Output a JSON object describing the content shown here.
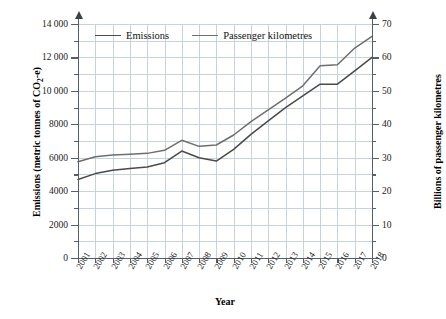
{
  "chart_data": {
    "type": "line",
    "title": "",
    "xlabel": "Year",
    "ylabel": "Emissions (metric tonnes of CO2-e)",
    "y2label": "Billions of passenger kilometres",
    "grid": true,
    "legend_position": "top-left-inside",
    "categories": [
      "2001",
      "2002",
      "2003",
      "2004",
      "2005",
      "2006",
      "2007",
      "2008",
      "2009",
      "2010",
      "2011",
      "2012",
      "2013",
      "2014",
      "2015",
      "2016",
      "2017",
      "2018"
    ],
    "xlim": [
      2001,
      2018
    ],
    "ylim": [
      0,
      14000
    ],
    "y2lim": [
      0,
      70
    ],
    "yticks": [
      0,
      2000,
      4000,
      6000,
      8000,
      10000,
      12000,
      14000
    ],
    "ytick_labels": [
      "0",
      "2000",
      "4000",
      "6000",
      "8000",
      "10 000",
      "12 000",
      "14 000"
    ],
    "y2ticks": [
      0,
      10,
      20,
      30,
      40,
      50,
      60,
      70
    ],
    "y2tick_labels": [
      "0",
      "10",
      "20",
      "30",
      "40",
      "50",
      "60",
      "70"
    ],
    "series": [
      {
        "name": "Emissions",
        "axis": "left",
        "units": "metric tonnes of CO2-e",
        "color": "#4a4a4a",
        "values": [
          4700,
          5050,
          5250,
          5350,
          5450,
          5700,
          6400,
          6000,
          5800,
          6500,
          7400,
          8200,
          9000,
          9700,
          10400,
          10400,
          11200,
          12000
        ]
      },
      {
        "name": "Passenger kilometres",
        "axis": "right",
        "units": "billions of passenger kilometres",
        "color": "#6e6e6e",
        "values": [
          28.8,
          30.3,
          30.8,
          31.0,
          31.3,
          32.2,
          35.2,
          33.4,
          33.8,
          36.8,
          40.8,
          44.3,
          47.8,
          51.5,
          57.5,
          57.8,
          62.8,
          66.3
        ]
      }
    ]
  },
  "axis_titles": {
    "x": "Year",
    "y_left_prefix": "Emissions (metric tonnes of CO",
    "y_left_sub": "2",
    "y_left_suffix": "-e)",
    "y_right": "Billions of passenger kilometres"
  },
  "legend": {
    "items": [
      {
        "label": "Emissions",
        "icon": "line-swatch-icon"
      },
      {
        "label": "Passenger kilometres",
        "icon": "line-swatch-icon"
      }
    ]
  }
}
